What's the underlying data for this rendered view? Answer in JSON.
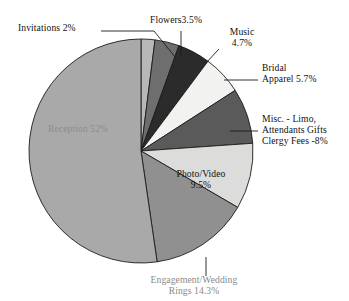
{
  "chart_data": {
    "type": "pie",
    "title": "",
    "subtitle": "",
    "xlabel": "",
    "ylabel": "",
    "legend_position": "none",
    "grid": false,
    "categories": [
      "Invitations",
      "Flowers",
      "Music",
      "Bridal Apparel",
      "Misc. - Limo, Attendants Gifts, Clergy Fees",
      "Photo/Video",
      "Engagement/Wedding Rings",
      "Reception"
    ],
    "values": [
      2,
      3.5,
      4.7,
      5.7,
      8,
      9.5,
      14.3,
      52.3
    ],
    "value_unit": "%",
    "colors": [
      "#b8b8b8",
      "#6e6e6e",
      "#2b2b2b",
      "#f2f2f0",
      "#5a5a5a",
      "#dcdcda",
      "#909090",
      "#a9a9a9"
    ],
    "slice_edge_color": "#1c1c1c",
    "start_angle_deg": -90,
    "direction": "clockwise"
  },
  "labels": {
    "invitations": {
      "text": "Invitations 2%"
    },
    "flowers": {
      "text": "Flowers3.5%"
    },
    "music": {
      "line1": "Music",
      "line2": "4.7%"
    },
    "bridal": {
      "line1": "Bridal",
      "line2": "Apparel 5.7%"
    },
    "misc": {
      "line1": "Misc. - Limo,",
      "line2": "Attendants Gifts",
      "line3": "Clergy Fees -8%"
    },
    "photo": {
      "line1": "Photo/Video",
      "line2": "9.5%"
    },
    "rings": {
      "line1": "Engagement/Wedding",
      "line2": "Rings  14.3%"
    },
    "reception": {
      "text": "Reception 52%"
    }
  }
}
